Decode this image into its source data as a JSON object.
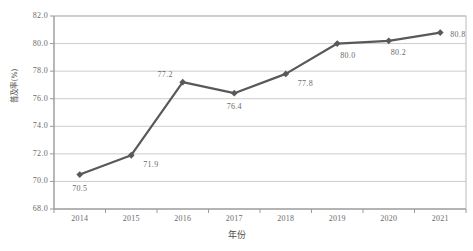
{
  "chart_data": {
    "type": "line",
    "title": "",
    "xlabel": "年份",
    "ylabel": "普及率(%)",
    "categories": [
      "2014",
      "2015",
      "2016",
      "2017",
      "2018",
      "2019",
      "2020",
      "2021"
    ],
    "values": [
      70.5,
      71.9,
      77.2,
      76.4,
      77.8,
      80.0,
      80.2,
      80.8
    ],
    "point_labels": [
      "70.5",
      "71.9",
      "77.2",
      "76.4",
      "77.8",
      "80.0",
      "80.2",
      "80.8"
    ],
    "ylim": [
      68.0,
      82.0
    ],
    "ytick_labels": [
      "82.0",
      "80.0",
      "78.0",
      "76.0",
      "74.0",
      "72.0",
      "70.0",
      "68.0"
    ],
    "ytick_values": [
      82.0,
      80.0,
      78.0,
      76.0,
      74.0,
      72.0,
      70.0,
      68.0
    ],
    "grid": "horizontal",
    "legend": "none",
    "series_color": "#595959",
    "grid_color": "#bfbfbf",
    "marker": "diamond"
  }
}
